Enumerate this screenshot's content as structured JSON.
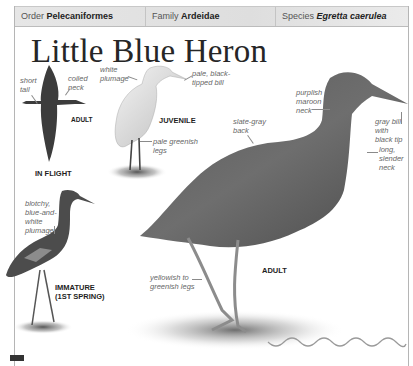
{
  "header": {
    "order_label": "Order",
    "order_value": "Pelecaniformes",
    "family_label": "Family",
    "family_value": "Ardeidae",
    "species_label": "Species",
    "species_value": "Egretta caerulea"
  },
  "title": "Little Blue Heron",
  "figures": {
    "in_flight": {
      "caption": "IN FLIGHT",
      "sub_caption": "ADULT",
      "labels": {
        "tail": "short\ntail",
        "neck": "coiled\nneck"
      }
    },
    "juvenile": {
      "caption": "JUVENILE",
      "labels": {
        "plumage": "white\nplumage",
        "bill": "pale, black-\ntipped bill",
        "legs": "pale greenish\nlegs"
      }
    },
    "immature": {
      "caption": "IMMATURE\n(1ST SPRING)",
      "labels": {
        "plumage": "blotchy,\nblue-and-\nwhite\nplumage"
      }
    },
    "adult": {
      "caption": "ADULT",
      "labels": {
        "back": "slate-gray\nback",
        "neck_color": "purplish\nmaroon\nneck",
        "bill": "gray bill\nwith\nblack tip",
        "neck_shape": "long,\nslender\nneck",
        "legs": "yellowish to\ngreenish legs"
      }
    }
  },
  "colors": {
    "header_bg": "#e2e2e2",
    "border": "#b5b5b5",
    "title": "#262626",
    "label": "#666666",
    "caption": "#1e1e1e"
  }
}
